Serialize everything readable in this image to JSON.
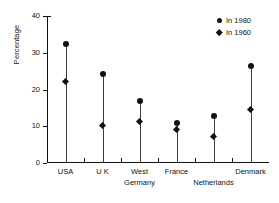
{
  "chart_data": {
    "type": "scatter",
    "title": "",
    "subtitle": "",
    "xlabel": "",
    "ylabel": "Percentage",
    "ylim": [
      0,
      40
    ],
    "yticks": [
      0,
      10,
      20,
      30,
      40
    ],
    "ytick_labels": [
      "0",
      "10",
      "20",
      "30",
      "40"
    ],
    "grid": false,
    "legend_position": "top-right",
    "categories": [
      "USA",
      "U K",
      "West Germany",
      "France",
      "Netherlands",
      "Denmark"
    ],
    "category_label_lines": [
      [
        "USA"
      ],
      [
        "U K"
      ],
      [
        "West",
        "Germany"
      ],
      [
        "France"
      ],
      [
        "",
        "Netherlands"
      ],
      [
        "Denmark"
      ]
    ],
    "series": [
      {
        "name": "In 1980",
        "marker": "circle",
        "color": "#111111",
        "values": [
          32.5,
          24.3,
          16.9,
          10.8,
          12.8,
          26.3
        ]
      },
      {
        "name": "In 1960",
        "marker": "diamond",
        "color": "#111111",
        "values": [
          22.1,
          10.2,
          11.2,
          9.0,
          7.3,
          14.5
        ]
      }
    ],
    "legend": [
      {
        "label": "In 1980",
        "marker": "circle"
      },
      {
        "label": "In 1960",
        "marker": "diamond"
      }
    ]
  },
  "colors": {
    "axis": "#111111",
    "marker": "#111111",
    "stem": "#3a3a3a",
    "background": "#ffffff"
  }
}
